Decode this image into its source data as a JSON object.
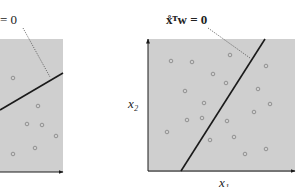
{
  "left_panel": {
    "label": "= 0",
    "region": {
      "x": 0,
      "y": 39,
      "w": 63,
      "h": 133
    },
    "boundary": {
      "x1": 0,
      "y1": 110,
      "x2": 63,
      "y2": 73
    },
    "pointer": {
      "x1": 23,
      "y1": 28,
      "x2": 50,
      "y2": 77
    },
    "points": [
      [
        13,
        78
      ],
      [
        38,
        106
      ],
      [
        27,
        124
      ],
      [
        42,
        125
      ],
      [
        56,
        136
      ],
      [
        35,
        148
      ],
      [
        13,
        154
      ]
    ]
  },
  "right_panel": {
    "label": "x̊ᵀw = 0",
    "x_axis_label": "x₁",
    "y_axis_label": "x₂",
    "region": {
      "x": 148,
      "y": 39,
      "w": 147,
      "h": 133
    },
    "boundary": {
      "x1": 181,
      "y1": 171,
      "x2": 265,
      "y2": 39
    },
    "pointer": {
      "x1": 208,
      "y1": 28,
      "x2": 250,
      "y2": 58
    },
    "points": [
      [
        171,
        61
      ],
      [
        192,
        62
      ],
      [
        230,
        55
      ],
      [
        213,
        74
      ],
      [
        226,
        83
      ],
      [
        185,
        91
      ],
      [
        266,
        66
      ],
      [
        258,
        89
      ],
      [
        270,
        104
      ],
      [
        204,
        103
      ],
      [
        254,
        112
      ],
      [
        187,
        120
      ],
      [
        202,
        118
      ],
      [
        227,
        121
      ],
      [
        167,
        132
      ],
      [
        234,
        137
      ],
      [
        210,
        140
      ],
      [
        266,
        149
      ],
      [
        245,
        154
      ]
    ]
  },
  "colors": {
    "region_fill": "#cfcfcf",
    "line": "#1a1a1a",
    "point_stroke": "#8a8a8a",
    "pointer": "#555555"
  }
}
